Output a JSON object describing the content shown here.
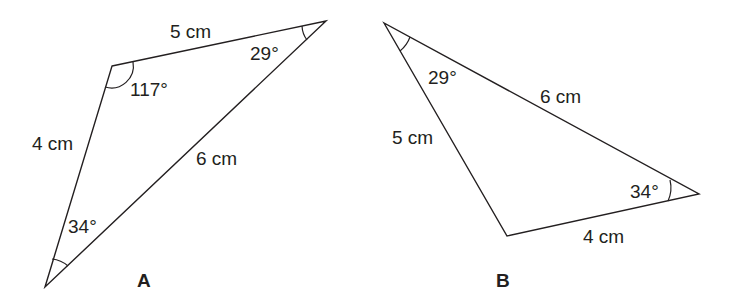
{
  "diagram": {
    "colors": {
      "stroke": "#231f20",
      "background": "#ffffff"
    },
    "triangles": [
      {
        "name": "A",
        "vertices": [
          [
            112,
            66
          ],
          [
            326,
            21
          ],
          [
            45,
            287
          ]
        ],
        "sides": [
          {
            "label": "5 cm",
            "between": [
              "top-left",
              "top-right"
            ]
          },
          {
            "label": "4 cm",
            "between": [
              "top-left",
              "bottom"
            ]
          },
          {
            "label": "6 cm",
            "between": [
              "top-right",
              "bottom"
            ]
          }
        ],
        "angles": [
          {
            "label": "117°",
            "vertex": "top-left"
          },
          {
            "label": "29°",
            "vertex": "top-right"
          },
          {
            "label": "34°",
            "vertex": "bottom"
          }
        ]
      },
      {
        "name": "B",
        "vertices": [
          [
            384,
            23
          ],
          [
            507,
            236
          ],
          [
            699,
            194
          ]
        ],
        "sides": [
          {
            "label": "6 cm",
            "between": [
              "top",
              "right"
            ]
          },
          {
            "label": "5 cm",
            "between": [
              "top",
              "bottom"
            ]
          },
          {
            "label": "4 cm",
            "between": [
              "bottom",
              "right"
            ]
          }
        ],
        "angles": [
          {
            "label": "29°",
            "vertex": "top"
          },
          {
            "label": "34°",
            "vertex": "right"
          }
        ]
      }
    ]
  }
}
